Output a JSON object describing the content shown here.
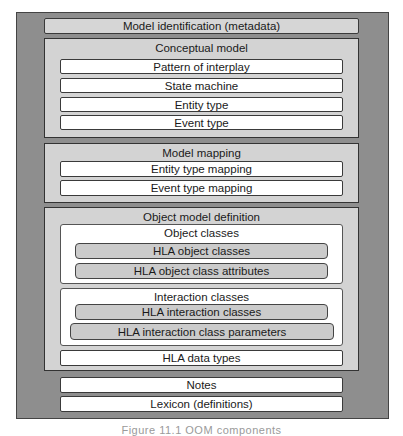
{
  "diagram": {
    "model_identification": "Model identification (metadata)",
    "conceptual_model": {
      "title": "Conceptual model",
      "items": [
        "Pattern of interplay",
        "State machine",
        "Entity type",
        "Event type"
      ]
    },
    "model_mapping": {
      "title": "Model mapping",
      "items": [
        "Entity type mapping",
        "Event type mapping"
      ]
    },
    "object_model_definition": {
      "title": "Object model definition",
      "object_classes": {
        "title": "Object classes",
        "items": [
          "HLA object classes",
          "HLA object class attributes"
        ]
      },
      "interaction_classes": {
        "title": "Interaction classes",
        "items": [
          "HLA interaction classes",
          "HLA interaction class parameters"
        ]
      },
      "data_types": "HLA data types"
    },
    "notes": "Notes",
    "lexicon": "Lexicon (definitions)"
  },
  "caption": "Figure 11.1 OOM components"
}
